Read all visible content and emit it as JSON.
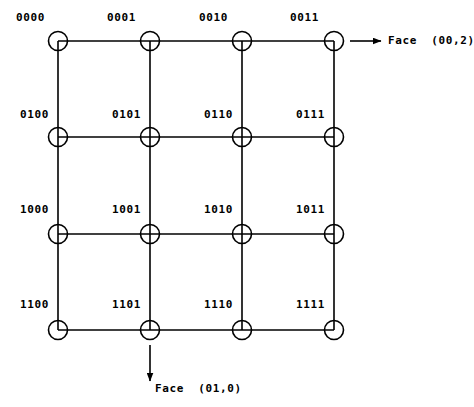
{
  "figure": {
    "background_color": "#ffffff",
    "line_color": "#000000",
    "node_fill": "#ffffff",
    "node_radius": 9.5,
    "line_width": 1.6,
    "width": 474,
    "height": 407
  },
  "grid": {
    "columns_x": [
      58,
      150,
      242,
      334
    ],
    "rows_y": [
      41,
      137,
      234,
      330
    ],
    "nodes": [
      {
        "id": "0000",
        "label": "0000",
        "col": 0,
        "row": 0,
        "cx": 58,
        "cy": 41,
        "label_x": 16,
        "label_y": 12
      },
      {
        "id": "0001",
        "label": "0001",
        "col": 1,
        "row": 0,
        "cx": 150,
        "cy": 41,
        "label_x": 107,
        "label_y": 12
      },
      {
        "id": "0010",
        "label": "0010",
        "col": 2,
        "row": 0,
        "cx": 242,
        "cy": 41,
        "label_x": 199,
        "label_y": 12
      },
      {
        "id": "0011",
        "label": "0011",
        "col": 3,
        "row": 0,
        "cx": 334,
        "cy": 41,
        "label_x": 290,
        "label_y": 12
      },
      {
        "id": "0100",
        "label": "0100",
        "col": 0,
        "row": 1,
        "cx": 58,
        "cy": 137,
        "label_x": 20,
        "label_y": 109
      },
      {
        "id": "0101",
        "label": "0101",
        "col": 1,
        "row": 1,
        "cx": 150,
        "cy": 137,
        "label_x": 112,
        "label_y": 109
      },
      {
        "id": "0110",
        "label": "0110",
        "col": 2,
        "row": 1,
        "cx": 242,
        "cy": 137,
        "label_x": 204,
        "label_y": 109
      },
      {
        "id": "0111",
        "label": "0111",
        "col": 3,
        "row": 1,
        "cx": 334,
        "cy": 137,
        "label_x": 296,
        "label_y": 109
      },
      {
        "id": "1000",
        "label": "1000",
        "col": 0,
        "row": 2,
        "cx": 58,
        "cy": 234,
        "label_x": 20,
        "label_y": 204
      },
      {
        "id": "1001",
        "label": "1001",
        "col": 1,
        "row": 2,
        "cx": 150,
        "cy": 234,
        "label_x": 112,
        "label_y": 204
      },
      {
        "id": "1010",
        "label": "1010",
        "col": 2,
        "row": 2,
        "cx": 242,
        "cy": 234,
        "label_x": 204,
        "label_y": 204
      },
      {
        "id": "1011",
        "label": "1011",
        "col": 3,
        "row": 2,
        "cx": 334,
        "cy": 234,
        "label_x": 296,
        "label_y": 204
      },
      {
        "id": "1100",
        "label": "1100",
        "col": 0,
        "row": 3,
        "cx": 58,
        "cy": 330,
        "label_x": 20,
        "label_y": 299
      },
      {
        "id": "1101",
        "label": "1101",
        "col": 1,
        "row": 3,
        "cx": 150,
        "cy": 330,
        "label_x": 112,
        "label_y": 299
      },
      {
        "id": "1110",
        "label": "1110",
        "col": 2,
        "row": 3,
        "cx": 242,
        "cy": 330,
        "label_x": 204,
        "label_y": 299
      },
      {
        "id": "1111",
        "label": "1111",
        "col": 3,
        "row": 3,
        "cx": 334,
        "cy": 330,
        "label_x": 296,
        "label_y": 299
      }
    ],
    "horizontal_edges": [
      {
        "y": 41,
        "x1": 58,
        "x2": 334
      },
      {
        "y": 137,
        "x1": 58,
        "x2": 334
      },
      {
        "y": 234,
        "x1": 58,
        "x2": 334
      },
      {
        "y": 330,
        "x1": 58,
        "x2": 334
      }
    ],
    "vertical_edges": [
      {
        "x": 58,
        "y1": 41,
        "y2": 330
      },
      {
        "x": 150,
        "y1": 41,
        "y2": 330
      },
      {
        "x": 242,
        "y1": 41,
        "y2": 330
      },
      {
        "x": 334,
        "y1": 41,
        "y2": 330
      }
    ]
  },
  "annotations": [
    {
      "id": "face-00-2",
      "text": "Face  (00,2)",
      "direction": "right",
      "arrow": {
        "x1": 350,
        "y1": 41,
        "x2": 381,
        "y2": 41
      },
      "label_x": 388,
      "label_y": 35
    },
    {
      "id": "face-01-0",
      "text": "Face  (01,0)",
      "direction": "down",
      "arrow": {
        "x1": 150,
        "y1": 345,
        "x2": 150,
        "y2": 381
      },
      "label_x": 155,
      "label_y": 383
    }
  ]
}
